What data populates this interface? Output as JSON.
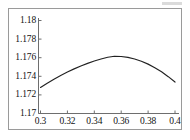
{
  "chart_data": {
    "type": "line",
    "title": "",
    "subtitle": "",
    "xlabel": "",
    "ylabel": "",
    "xlim": [
      0.3,
      0.4
    ],
    "ylim": [
      1.17,
      1.18
    ],
    "grid": false,
    "legend": false,
    "legend_position": "none",
    "line_color": "#222222",
    "frame_color": "#9a9a9a",
    "background_color": "#ffffff",
    "annotations": [],
    "xticks": [
      {
        "value": 0.3,
        "label": "0.3"
      },
      {
        "value": 0.32,
        "label": "0.32"
      },
      {
        "value": 0.34,
        "label": "0.34"
      },
      {
        "value": 0.36,
        "label": "0.36"
      },
      {
        "value": 0.38,
        "label": "0.38"
      },
      {
        "value": 0.4,
        "label": "0.4"
      }
    ],
    "yticks": [
      {
        "value": 1.17,
        "label": "1.17"
      },
      {
        "value": 1.172,
        "label": "1.172"
      },
      {
        "value": 1.174,
        "label": "1.174"
      },
      {
        "value": 1.176,
        "label": "1.176"
      },
      {
        "value": 1.178,
        "label": "1.178"
      },
      {
        "value": 1.18,
        "label": "1.18"
      }
    ],
    "series": [
      {
        "name": "curve",
        "x": [
          0.3,
          0.305,
          0.31,
          0.315,
          0.32,
          0.325,
          0.33,
          0.335,
          0.34,
          0.345,
          0.35,
          0.355,
          0.36,
          0.365,
          0.37,
          0.375,
          0.38,
          0.385,
          0.39,
          0.395,
          0.4
        ],
        "y": [
          1.1728,
          1.17326,
          1.17369,
          1.17409,
          1.17446,
          1.1748,
          1.17511,
          1.17539,
          1.17564,
          1.17586,
          1.17605,
          1.17615,
          1.17613,
          1.17603,
          1.17586,
          1.17562,
          1.17531,
          1.17493,
          1.17448,
          1.17396,
          1.17338
        ]
      }
    ],
    "peak": {
      "x": 0.3555,
      "y": 1.17616
    }
  }
}
